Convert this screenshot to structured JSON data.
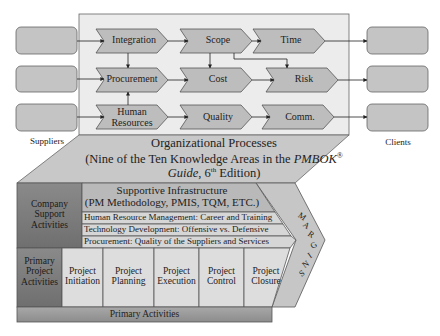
{
  "colors": {
    "process_area_bg": "#ececec",
    "chevron_fill": "#bdbdbd",
    "chevron_stroke": "#555555",
    "endpoint_box_fill": "#c4c4c4",
    "trapezoid_fill": "#c8c8c8",
    "company_support_fill": "#7e7e7e",
    "primary_project_fill": "#8a8a8a",
    "primary_activities_fill": "#9a9a9a",
    "infrastructure_fill": "#b9b9b9",
    "support_row_fill": "#d6d6d6",
    "phase_cell_fill": "#dddddd",
    "margins_fill": "#c6c6c6"
  },
  "suppliers": {
    "label": "Suppliers",
    "boxes": 3
  },
  "clients": {
    "label": "Clients",
    "boxes": 3
  },
  "knowledge_areas": {
    "row1": [
      "Integration",
      "Scope",
      "Time"
    ],
    "row2": [
      "Procurement",
      "Cost",
      "Risk"
    ],
    "row3": [
      "Human Resources",
      "Quality",
      "Comm."
    ]
  },
  "knowledge_area_labels": {
    "integration": "Integration",
    "scope": "Scope",
    "time": "Time",
    "procurement": "Procurement",
    "cost": "Cost",
    "risk": "Risk",
    "human_resources_line1": "Human",
    "human_resources_line2": "Resources",
    "quality": "Quality",
    "comm": "Comm."
  },
  "organizational_processes": {
    "title": "Organizational Processes",
    "subtitle_line1_prefix": "(Nine of the Ten Knowledge Areas in the ",
    "subtitle_line1_italic": "PMBOK",
    "subtitle_line1_sup": "®",
    "subtitle_line2_italic": "Guide",
    "subtitle_line2_mid": ", 6",
    "subtitle_line2_sup": "th",
    "subtitle_line2_suffix": " Edition)"
  },
  "value_chain": {
    "company_support": {
      "line1": "Company",
      "line2": "Support",
      "line3": "Activities"
    },
    "supportive_infrastructure": {
      "line1": "Supportive Infrastructure",
      "line2": "(PM Methodology, PMIS, TQM, ETC.)"
    },
    "support_rows": [
      "Human Resource Management: Career and Training",
      "Technology Development: Offensive vs. Defensive",
      "Procurement: Quality of the Suppliers and Services"
    ],
    "primary_project": {
      "line1": "Primary",
      "line2": "Project",
      "line3": "Activities"
    },
    "phases": [
      {
        "line1": "Project",
        "line2": "Initiation"
      },
      {
        "line1": "Project",
        "line2": "Planning"
      },
      {
        "line1": "Project",
        "line2": "Execution"
      },
      {
        "line1": "Project",
        "line2": "Control"
      },
      {
        "line1": "Project",
        "line2": "Closure"
      }
    ],
    "primary_activities": "Primary Activities",
    "margins_letters": [
      "M",
      "A",
      "R",
      "G",
      "I",
      "N",
      "S"
    ]
  }
}
